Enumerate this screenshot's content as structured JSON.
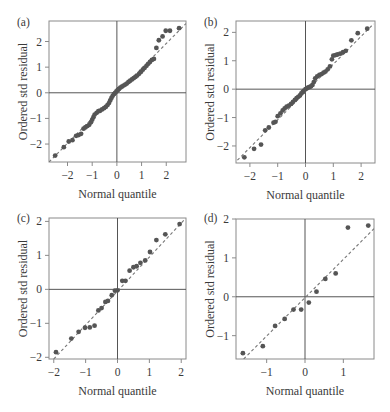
{
  "chart_data": [
    {
      "type": "scatter",
      "panel_label": "(a)",
      "xlabel": "Normal quantile",
      "ylabel": "Ordered std residual",
      "xlim": [
        -2.75,
        2.8
      ],
      "ylim": [
        -2.7,
        2.8
      ],
      "xticks": [
        -2,
        -1,
        0,
        1,
        2
      ],
      "yticks": [
        -2,
        -1,
        0,
        1,
        2
      ],
      "reference_lines": {
        "x": 0,
        "y": 0
      },
      "fit_line": {
        "style": "dashed",
        "points": [
          [
            -2.75,
            -2.7
          ],
          [
            2.8,
            2.7
          ]
        ]
      },
      "points": [
        [
          -2.5,
          -2.45
        ],
        [
          -2.15,
          -2.12
        ],
        [
          -1.95,
          -1.9
        ],
        [
          -1.8,
          -1.85
        ],
        [
          -1.65,
          -1.68
        ],
        [
          -1.55,
          -1.65
        ],
        [
          -1.45,
          -1.6
        ],
        [
          -1.35,
          -1.4
        ],
        [
          -1.28,
          -1.35
        ],
        [
          -1.2,
          -1.3
        ],
        [
          -1.12,
          -1.25
        ],
        [
          -1.05,
          -1.15
        ],
        [
          -1.0,
          -1.05
        ],
        [
          -0.95,
          -0.95
        ],
        [
          -0.9,
          -0.85
        ],
        [
          -0.82,
          -0.78
        ],
        [
          -0.75,
          -0.72
        ],
        [
          -0.68,
          -0.7
        ],
        [
          -0.6,
          -0.65
        ],
        [
          -0.52,
          -0.6
        ],
        [
          -0.45,
          -0.55
        ],
        [
          -0.38,
          -0.48
        ],
        [
          -0.32,
          -0.4
        ],
        [
          -0.27,
          -0.3
        ],
        [
          -0.22,
          -0.2
        ],
        [
          -0.17,
          -0.12
        ],
        [
          -0.12,
          -0.05
        ],
        [
          -0.07,
          0.0
        ],
        [
          -0.02,
          0.05
        ],
        [
          0.03,
          0.1
        ],
        [
          0.08,
          0.15
        ],
        [
          0.14,
          0.2
        ],
        [
          0.2,
          0.24
        ],
        [
          0.27,
          0.28
        ],
        [
          0.34,
          0.32
        ],
        [
          0.4,
          0.36
        ],
        [
          0.47,
          0.42
        ],
        [
          0.54,
          0.47
        ],
        [
          0.61,
          0.52
        ],
        [
          0.68,
          0.57
        ],
        [
          0.75,
          0.62
        ],
        [
          0.82,
          0.67
        ],
        [
          0.9,
          0.74
        ],
        [
          0.98,
          0.82
        ],
        [
          1.05,
          0.9
        ],
        [
          1.12,
          0.97
        ],
        [
          1.2,
          1.05
        ],
        [
          1.27,
          1.13
        ],
        [
          1.34,
          1.2
        ],
        [
          1.42,
          1.28
        ],
        [
          1.5,
          1.32
        ],
        [
          1.6,
          1.75
        ],
        [
          1.7,
          2.05
        ],
        [
          1.85,
          2.2
        ],
        [
          1.98,
          2.42
        ],
        [
          2.15,
          2.42
        ],
        [
          2.52,
          2.52
        ]
      ]
    },
    {
      "type": "scatter",
      "panel_label": "(b)",
      "xlabel": "Normal quantile",
      "ylabel": "Ordered std residual",
      "xlim": [
        -2.5,
        2.5
      ],
      "ylim": [
        -2.6,
        2.4
      ],
      "xticks": [
        -2,
        -1,
        0,
        1,
        2
      ],
      "yticks": [
        -2,
        -1,
        0,
        1,
        2
      ],
      "reference_lines": {
        "x": 0,
        "y": 0
      },
      "fit_line": {
        "style": "dashed",
        "points": [
          [
            -2.45,
            -2.5
          ],
          [
            2.45,
            2.3
          ]
        ]
      },
      "points": [
        [
          -2.2,
          -2.4
        ],
        [
          -1.85,
          -2.1
        ],
        [
          -1.6,
          -1.95
        ],
        [
          -1.45,
          -1.45
        ],
        [
          -1.32,
          -1.35
        ],
        [
          -1.15,
          -1.18
        ],
        [
          -1.08,
          -1.15
        ],
        [
          -1.0,
          -0.95
        ],
        [
          -0.9,
          -0.85
        ],
        [
          -0.82,
          -0.75
        ],
        [
          -0.75,
          -0.68
        ],
        [
          -0.68,
          -0.62
        ],
        [
          -0.6,
          -0.58
        ],
        [
          -0.52,
          -0.52
        ],
        [
          -0.45,
          -0.45
        ],
        [
          -0.38,
          -0.38
        ],
        [
          -0.32,
          -0.32
        ],
        [
          -0.26,
          -0.27
        ],
        [
          -0.2,
          -0.22
        ],
        [
          -0.15,
          -0.15
        ],
        [
          -0.1,
          -0.1
        ],
        [
          -0.05,
          -0.05
        ],
        [
          0.0,
          0.0
        ],
        [
          0.05,
          0.03
        ],
        [
          0.1,
          0.06
        ],
        [
          0.15,
          0.08
        ],
        [
          0.2,
          0.1
        ],
        [
          0.25,
          0.15
        ],
        [
          0.3,
          0.25
        ],
        [
          0.35,
          0.38
        ],
        [
          0.42,
          0.45
        ],
        [
          0.5,
          0.5
        ],
        [
          0.58,
          0.53
        ],
        [
          0.65,
          0.58
        ],
        [
          0.72,
          0.62
        ],
        [
          0.8,
          0.7
        ],
        [
          0.88,
          0.8
        ],
        [
          0.95,
          1.05
        ],
        [
          1.0,
          1.18
        ],
        [
          1.08,
          1.2
        ],
        [
          1.15,
          1.22
        ],
        [
          1.25,
          1.25
        ],
        [
          1.35,
          1.3
        ],
        [
          1.45,
          1.35
        ],
        [
          1.65,
          1.72
        ],
        [
          1.88,
          1.97
        ],
        [
          2.22,
          2.13
        ]
      ]
    },
    {
      "type": "scatter",
      "panel_label": "(c)",
      "xlabel": "Normal quantile",
      "ylabel": "Ordered std residual",
      "xlim": [
        -2.15,
        2.15
      ],
      "ylim": [
        -2.05,
        2.1
      ],
      "xticks": [
        -2,
        -1,
        0,
        1,
        2
      ],
      "yticks": [
        -2,
        -1,
        0,
        1,
        2
      ],
      "reference_lines": {
        "x": 0,
        "y": 0
      },
      "fit_line": {
        "style": "dashed",
        "points": [
          [
            -2.0,
            -2.05
          ],
          [
            2.1,
            2.05
          ]
        ]
      },
      "points": [
        [
          -1.93,
          -1.85
        ],
        [
          -1.45,
          -1.45
        ],
        [
          -1.22,
          -1.25
        ],
        [
          -1.02,
          -1.13
        ],
        [
          -0.87,
          -1.12
        ],
        [
          -0.72,
          -1.07
        ],
        [
          -0.6,
          -0.62
        ],
        [
          -0.5,
          -0.55
        ],
        [
          -0.38,
          -0.37
        ],
        [
          -0.3,
          -0.34
        ],
        [
          -0.18,
          -0.17
        ],
        [
          -0.08,
          -0.04
        ],
        [
          0.0,
          -0.03
        ],
        [
          0.15,
          0.25
        ],
        [
          0.25,
          0.25
        ],
        [
          0.38,
          0.55
        ],
        [
          0.5,
          0.65
        ],
        [
          0.6,
          0.68
        ],
        [
          0.72,
          0.78
        ],
        [
          0.87,
          0.85
        ],
        [
          1.02,
          1.1
        ],
        [
          1.22,
          1.45
        ],
        [
          1.5,
          1.62
        ],
        [
          1.95,
          1.92
        ]
      ]
    },
    {
      "type": "scatter",
      "panel_label": "(d)",
      "xlabel": "Normal quantile",
      "ylabel": "Ordered std residual",
      "xlim": [
        -1.8,
        1.8
      ],
      "ylim": [
        -1.6,
        2.0
      ],
      "xticks": [
        -1,
        0,
        1
      ],
      "yticks": [
        -1,
        0,
        1,
        2
      ],
      "reference_lines": {
        "x": 0,
        "y": 0
      },
      "fit_line": {
        "style": "dashed",
        "points": [
          [
            -1.6,
            -1.6
          ],
          [
            1.8,
            1.75
          ]
        ]
      },
      "points": [
        [
          -1.62,
          -1.45
        ],
        [
          -1.1,
          -1.27
        ],
        [
          -0.78,
          -0.75
        ],
        [
          -0.53,
          -0.57
        ],
        [
          -0.3,
          -0.33
        ],
        [
          -0.1,
          -0.33
        ],
        [
          0.1,
          -0.15
        ],
        [
          0.3,
          0.13
        ],
        [
          0.53,
          0.46
        ],
        [
          0.8,
          0.6
        ],
        [
          1.12,
          1.78
        ],
        [
          1.65,
          1.83
        ]
      ]
    }
  ]
}
